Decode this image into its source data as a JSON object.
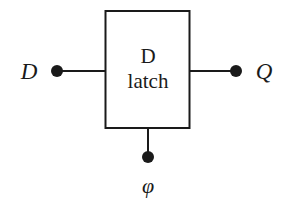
{
  "diagram": {
    "type": "logic-block",
    "block": {
      "title_line1": "D",
      "title_line2": "latch"
    },
    "ports": {
      "input": {
        "label": "D",
        "side": "left"
      },
      "output": {
        "label": "Q",
        "side": "right"
      },
      "clock": {
        "label": "φ",
        "side": "bottom"
      }
    },
    "colors": {
      "stroke": "#1a1a1a",
      "background": "#ffffff"
    }
  }
}
